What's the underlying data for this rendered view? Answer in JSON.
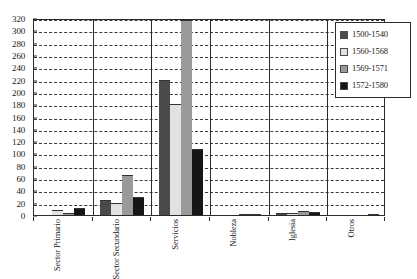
{
  "chart_data": {
    "type": "bar",
    "title": "",
    "subtitle": "",
    "xlabel": "",
    "ylabel": "",
    "ylim": [
      0,
      320
    ],
    "ytick_step": 20,
    "yticks": [
      0,
      20,
      40,
      60,
      80,
      100,
      120,
      140,
      160,
      180,
      200,
      220,
      240,
      260,
      280,
      300,
      320
    ],
    "grid": true,
    "grid_style": "dashed-horizontal",
    "legend_position": "top-right",
    "categories": [
      "Sector Primario",
      "Sector Secundario",
      "Servicios",
      "Nobleza",
      "Iglesia",
      "Otros"
    ],
    "category_labels_rotated": true,
    "series": [
      {
        "name": "1500-1540",
        "color": "#4a4a4a",
        "values": [
          0,
          24,
          220,
          0,
          3,
          0
        ]
      },
      {
        "name": "1560-1568",
        "color": "#e2e2e2",
        "values": [
          8,
          20,
          181,
          0,
          4,
          0
        ]
      },
      {
        "name": "1569-1571",
        "color": "#9a9a9a",
        "values": [
          4,
          65,
          316,
          2,
          6,
          0
        ]
      },
      {
        "name": "1572-1580",
        "color": "#161616",
        "values": [
          11,
          29,
          108,
          1,
          5,
          1
        ]
      }
    ]
  },
  "legend": {
    "items": [
      {
        "label": "1500-1540",
        "color": "#4a4a4a"
      },
      {
        "label": "1560-1568",
        "color": "#e2e2e2"
      },
      {
        "label": "1569-1571",
        "color": "#9a9a9a"
      },
      {
        "label": "1572-1580",
        "color": "#161616"
      }
    ]
  },
  "axis": {
    "y_tick_labels": [
      "320",
      "300",
      "280",
      "260",
      "240",
      "220",
      "200",
      "180",
      "160",
      "140",
      "120",
      "100",
      "80",
      "60",
      "40",
      "20",
      "0"
    ],
    "x_tick_labels": [
      "Sector Primario",
      "Sector Secundario",
      "Servicios",
      "Nobleza",
      "Iglesia",
      "Otros"
    ]
  },
  "colors": {
    "axis": "#2b2b2b",
    "grid": "#3a3a3a",
    "background": "#ffffff"
  }
}
